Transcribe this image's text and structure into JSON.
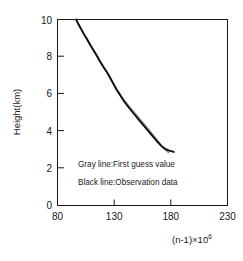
{
  "chart_data": {
    "type": "line",
    "title": "",
    "xlabel": "(n-1)×10⁶",
    "xlabel_base": "(n-1)×10",
    "xlabel_exp": "6",
    "ylabel": "Height(km)",
    "xlim": [
      80,
      230
    ],
    "ylim": [
      0,
      10
    ],
    "xticks": [
      80,
      130,
      180,
      230
    ],
    "xticklabels": [
      "80",
      "130",
      "180",
      "230"
    ],
    "yticks": [
      0,
      2,
      4,
      6,
      8,
      10
    ],
    "yticklabels": [
      "0",
      "2",
      "4",
      "6",
      "8",
      "10"
    ],
    "grid": false,
    "legend_position": "inside-lower-center",
    "annotations": [
      "Gray line:First guess value",
      "Black line:Observation data"
    ],
    "series": [
      {
        "name": "Observation data",
        "style": "Black line",
        "color": "#111111",
        "width": 1.9,
        "points": [
          [
            96.5,
            10.0
          ],
          [
            98.0,
            9.8
          ],
          [
            99.8,
            9.6
          ],
          [
            101.6,
            9.4
          ],
          [
            103.4,
            9.2
          ],
          [
            105.4,
            9.0
          ],
          [
            107.3,
            8.8
          ],
          [
            109.2,
            8.6
          ],
          [
            111.2,
            8.4
          ],
          [
            113.2,
            8.2
          ],
          [
            115.2,
            8.0
          ],
          [
            117.0,
            7.8
          ],
          [
            119.0,
            7.6
          ],
          [
            121.0,
            7.4
          ],
          [
            123.2,
            7.2
          ],
          [
            125.2,
            7.0
          ],
          [
            127.0,
            6.8
          ],
          [
            128.8,
            6.6
          ],
          [
            130.6,
            6.4
          ],
          [
            132.4,
            6.2
          ],
          [
            134.6,
            6.0
          ],
          [
            136.6,
            5.8
          ],
          [
            138.8,
            5.6
          ],
          [
            141.2,
            5.4
          ],
          [
            143.8,
            5.2
          ],
          [
            146.4,
            5.0
          ],
          [
            149.2,
            4.8
          ],
          [
            151.8,
            4.6
          ],
          [
            154.6,
            4.4
          ],
          [
            157.4,
            4.2
          ],
          [
            160.2,
            4.0
          ],
          [
            163.0,
            3.8
          ],
          [
            165.8,
            3.6
          ],
          [
            168.6,
            3.4
          ],
          [
            171.6,
            3.2
          ],
          [
            175.0,
            3.05
          ],
          [
            178.6,
            2.95
          ],
          [
            182.6,
            2.88
          ]
        ]
      },
      {
        "name": "First guess value",
        "style": "Gray line",
        "color": "#8c8c8c",
        "width": 1.5,
        "points": [
          [
            96.5,
            10.0
          ],
          [
            98.2,
            9.8
          ],
          [
            100.0,
            9.6
          ],
          [
            101.8,
            9.4
          ],
          [
            103.6,
            9.2
          ],
          [
            105.6,
            9.0
          ],
          [
            107.5,
            8.8
          ],
          [
            109.4,
            8.6
          ],
          [
            111.4,
            8.4
          ],
          [
            113.4,
            8.2
          ],
          [
            115.4,
            8.0
          ],
          [
            117.2,
            7.8
          ],
          [
            119.2,
            7.6
          ],
          [
            121.2,
            7.4
          ],
          [
            123.4,
            7.2
          ],
          [
            125.4,
            7.0
          ],
          [
            127.2,
            6.8
          ],
          [
            129.0,
            6.6
          ],
          [
            130.8,
            6.4
          ],
          [
            132.8,
            6.2
          ],
          [
            135.0,
            6.0
          ],
          [
            137.2,
            5.8
          ],
          [
            139.6,
            5.6
          ],
          [
            142.2,
            5.4
          ],
          [
            145.0,
            5.2
          ],
          [
            147.8,
            5.0
          ],
          [
            150.6,
            4.8
          ],
          [
            153.4,
            4.6
          ],
          [
            156.2,
            4.4
          ],
          [
            159.0,
            4.2
          ],
          [
            161.6,
            4.0
          ],
          [
            164.2,
            3.8
          ],
          [
            166.8,
            3.6
          ],
          [
            169.4,
            3.4
          ],
          [
            171.8,
            3.2
          ],
          [
            174.2,
            3.05
          ],
          [
            176.4,
            2.92
          ],
          [
            178.2,
            2.84
          ]
        ]
      }
    ]
  },
  "figure": {
    "axis_color": "#1a1a1a",
    "background": "#ffffff"
  }
}
